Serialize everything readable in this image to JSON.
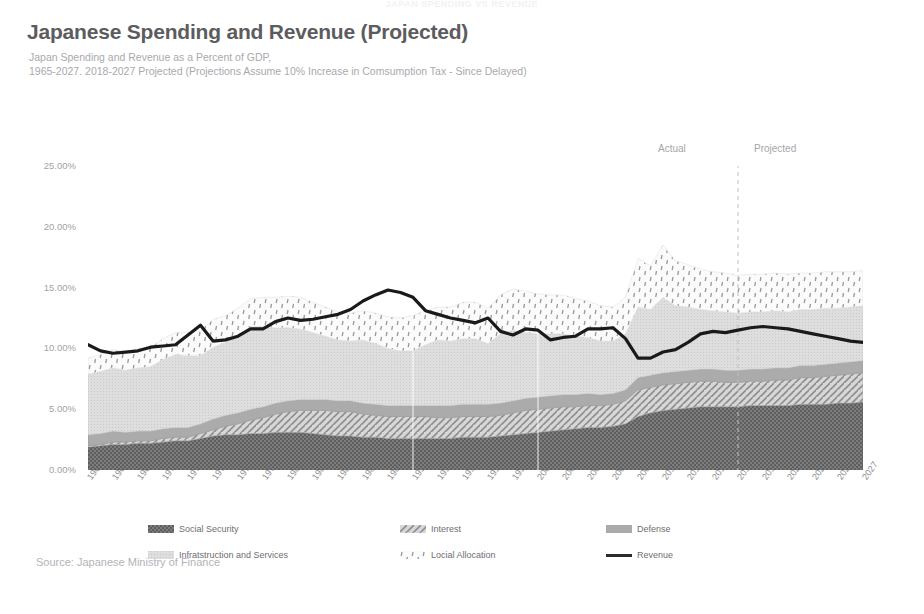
{
  "banner": "JAPAN SPENDING VS REVENUE",
  "header": {
    "title": "Japanese Spending and Revenue (Projected)",
    "subtitle_line1": "Japan Spending and Revenue as a Percent of GDP,",
    "subtitle_line2": "1965-2027. 2018-2027 Projected (Projections Assume 10% Increase in Comsumption Tax - Since Delayed)"
  },
  "annotations": {
    "actual": "Actual",
    "projected": "Projected",
    "divider_year": 2017
  },
  "source": "Source: Japanese Ministry of Finance",
  "legend": {
    "items": [
      {
        "label": "Social Security",
        "swatch": "social-security",
        "kind": "area"
      },
      {
        "label": "Interest",
        "swatch": "interest",
        "kind": "area"
      },
      {
        "label": "Defense",
        "swatch": "defense",
        "kind": "area"
      },
      {
        "label": "Infratstruction and Services",
        "swatch": "infrastructure",
        "kind": "area"
      },
      {
        "label": "Locial Allocation",
        "swatch": "local-allocation",
        "kind": "area"
      },
      {
        "label": "Revenue",
        "swatch": "revenue",
        "kind": "line"
      }
    ]
  },
  "colors": {
    "title": "#5c5c5e",
    "subtitle": "#a9a9ad",
    "axis_text": "#a2a2a6",
    "social_security": "#6b6b6b",
    "interest": "#c9c9c9",
    "defense": "#a8a8a8",
    "infrastructure": "#d8d8d8",
    "local_allocation": "#efefef",
    "revenue_line": "#1a1a1a",
    "divider": "#bfbfbf"
  },
  "chart_data": {
    "type": "area",
    "title": "Japanese Spending and Revenue (Projected)",
    "xlabel": "",
    "ylabel": "",
    "ylim": [
      0,
      25
    ],
    "ytick_labels": [
      "0.00%",
      "5.00%",
      "10.00%",
      "15.00%",
      "20.00%",
      "25.00%"
    ],
    "ytick_values": [
      0,
      5,
      10,
      15,
      20,
      25
    ],
    "grid": false,
    "legend_position": "bottom",
    "stacked": true,
    "x": [
      1965,
      1966,
      1967,
      1968,
      1969,
      1970,
      1971,
      1972,
      1973,
      1974,
      1975,
      1976,
      1977,
      1978,
      1979,
      1980,
      1981,
      1982,
      1983,
      1984,
      1985,
      1986,
      1987,
      1988,
      1989,
      1990,
      1991,
      1992,
      1993,
      1994,
      1995,
      1996,
      1997,
      1998,
      1999,
      2000,
      2001,
      2002,
      2003,
      2004,
      2005,
      2006,
      2007,
      2008,
      2009,
      2010,
      2011,
      2012,
      2013,
      2014,
      2015,
      2016,
      2017,
      2018,
      2019,
      2020,
      2021,
      2022,
      2023,
      2024,
      2025,
      2026,
      2027
    ],
    "xtick_labels": [
      "1965",
      "1967",
      "1969",
      "1971",
      "1973",
      "1975",
      "1977",
      "1979",
      "1981",
      "1983",
      "1985",
      "1987",
      "1989",
      "1991",
      "1993",
      "1995",
      "1997",
      "1999",
      "2001",
      "2003",
      "2005",
      "2007",
      "2009",
      "2011",
      "2013",
      "2015",
      "2017",
      "2019",
      "2021",
      "2023",
      "2025",
      "2027"
    ],
    "series": [
      {
        "name": "Social Security",
        "pattern": "checker",
        "values": [
          1.9,
          2.0,
          2.1,
          2.1,
          2.2,
          2.2,
          2.3,
          2.4,
          2.4,
          2.6,
          2.8,
          2.9,
          2.9,
          3.0,
          3.0,
          3.1,
          3.1,
          3.1,
          3.0,
          2.9,
          2.8,
          2.8,
          2.7,
          2.7,
          2.6,
          2.6,
          2.6,
          2.6,
          2.6,
          2.6,
          2.7,
          2.7,
          2.7,
          2.8,
          2.9,
          3.0,
          3.1,
          3.2,
          3.3,
          3.4,
          3.5,
          3.5,
          3.6,
          3.8,
          4.4,
          4.7,
          4.9,
          5.0,
          5.1,
          5.2,
          5.2,
          5.2,
          5.2,
          5.3,
          5.3,
          5.3,
          5.3,
          5.4,
          5.4,
          5.4,
          5.5,
          5.5,
          5.6
        ]
      },
      {
        "name": "Interest",
        "pattern": "diagonal",
        "values": [
          0.1,
          0.1,
          0.2,
          0.2,
          0.2,
          0.2,
          0.3,
          0.3,
          0.3,
          0.4,
          0.5,
          0.7,
          0.9,
          1.1,
          1.3,
          1.5,
          1.7,
          1.8,
          1.9,
          2.0,
          2.0,
          2.0,
          1.9,
          1.8,
          1.8,
          1.8,
          1.8,
          1.8,
          1.7,
          1.7,
          1.7,
          1.7,
          1.7,
          1.7,
          1.8,
          1.9,
          1.9,
          1.9,
          1.9,
          1.8,
          1.8,
          1.8,
          1.8,
          1.9,
          2.2,
          2.1,
          2.1,
          2.1,
          2.1,
          2.1,
          2.1,
          2.0,
          2.0,
          2.0,
          2.0,
          2.1,
          2.1,
          2.2,
          2.2,
          2.3,
          2.3,
          2.4,
          2.4
        ]
      },
      {
        "name": "Defense",
        "pattern": "solid",
        "values": [
          0.9,
          0.9,
          0.9,
          0.8,
          0.8,
          0.8,
          0.8,
          0.8,
          0.8,
          0.8,
          0.9,
          0.9,
          0.9,
          0.9,
          0.9,
          0.9,
          0.9,
          0.9,
          0.9,
          0.9,
          0.9,
          0.9,
          0.9,
          0.9,
          0.9,
          0.9,
          0.9,
          0.9,
          1.0,
          1.0,
          1.0,
          1.0,
          1.0,
          1.0,
          1.0,
          1.0,
          1.0,
          1.0,
          1.0,
          1.0,
          1.0,
          0.9,
          0.9,
          0.9,
          1.0,
          1.0,
          1.0,
          1.0,
          1.0,
          1.0,
          1.0,
          1.0,
          1.0,
          1.0,
          1.0,
          1.0,
          1.0,
          1.0,
          1.0,
          1.0,
          1.0,
          1.0,
          1.0
        ]
      },
      {
        "name": "Infratstruction and Services",
        "pattern": "fine-dot",
        "values": [
          5.0,
          5.1,
          5.2,
          5.1,
          5.2,
          5.3,
          5.7,
          6.0,
          5.9,
          5.6,
          5.9,
          6.0,
          6.4,
          6.8,
          6.6,
          6.2,
          6.0,
          5.8,
          5.5,
          5.2,
          5.0,
          4.9,
          5.2,
          5.0,
          4.7,
          4.5,
          4.5,
          5.0,
          5.4,
          5.3,
          5.4,
          5.4,
          5.0,
          5.7,
          5.8,
          5.4,
          5.2,
          5.1,
          5.0,
          4.8,
          4.6,
          4.4,
          4.3,
          4.6,
          5.8,
          5.4,
          6.2,
          5.4,
          5.2,
          4.9,
          4.8,
          4.8,
          4.7,
          4.7,
          4.7,
          4.7,
          4.6,
          4.6,
          4.6,
          4.6,
          4.5,
          4.5,
          4.5
        ]
      },
      {
        "name": "Locial Allocation",
        "pattern": "rain-dot",
        "values": [
          1.3,
          1.4,
          1.5,
          1.5,
          1.6,
          1.6,
          1.7,
          1.8,
          1.9,
          2.1,
          2.3,
          2.2,
          2.2,
          2.3,
          2.4,
          2.5,
          2.6,
          2.6,
          2.5,
          2.4,
          2.3,
          2.3,
          2.4,
          2.5,
          2.6,
          2.7,
          2.9,
          2.8,
          2.7,
          2.8,
          3.0,
          3.0,
          2.9,
          3.2,
          3.4,
          3.4,
          3.3,
          3.2,
          3.2,
          3.1,
          3.0,
          2.9,
          2.8,
          3.0,
          4.0,
          3.6,
          4.3,
          3.7,
          3.5,
          3.3,
          3.2,
          3.2,
          3.1,
          3.1,
          3.1,
          3.1,
          3.1,
          3.0,
          3.0,
          3.0,
          3.0,
          2.9,
          2.9
        ]
      },
      {
        "name": "Revenue",
        "kind": "line",
        "color": "#1a1a1a",
        "values": [
          10.3,
          9.8,
          9.6,
          9.7,
          9.8,
          10.1,
          10.2,
          10.3,
          11.1,
          11.9,
          10.6,
          10.7,
          11.0,
          11.6,
          11.6,
          12.2,
          12.5,
          12.3,
          12.4,
          12.6,
          12.8,
          13.2,
          13.9,
          14.4,
          14.8,
          14.6,
          14.2,
          13.1,
          12.8,
          12.5,
          12.3,
          12.1,
          12.5,
          11.4,
          11.1,
          11.6,
          11.5,
          10.7,
          10.9,
          11.0,
          11.6,
          11.6,
          11.7,
          10.8,
          9.2,
          9.2,
          9.7,
          9.9,
          10.5,
          11.2,
          11.4,
          11.3,
          11.5,
          11.7,
          11.8,
          11.7,
          11.6,
          11.4,
          11.2,
          11.0,
          10.8,
          10.6,
          10.5
        ]
      }
    ]
  }
}
